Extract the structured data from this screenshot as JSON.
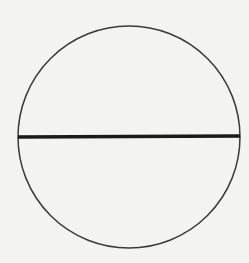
{
  "diagram": {
    "type": "circle-with-diameter",
    "background_color": "#f3f3f1",
    "circle": {
      "cx": 129,
      "cy": 137,
      "r": 111,
      "stroke": "#3a3a3a",
      "stroke_width": 1.5
    },
    "diameter": {
      "x1": 18,
      "y1": 137,
      "x2": 240,
      "y2": 136,
      "stroke": "#1a1a1a",
      "stroke_width": 3.5
    }
  }
}
